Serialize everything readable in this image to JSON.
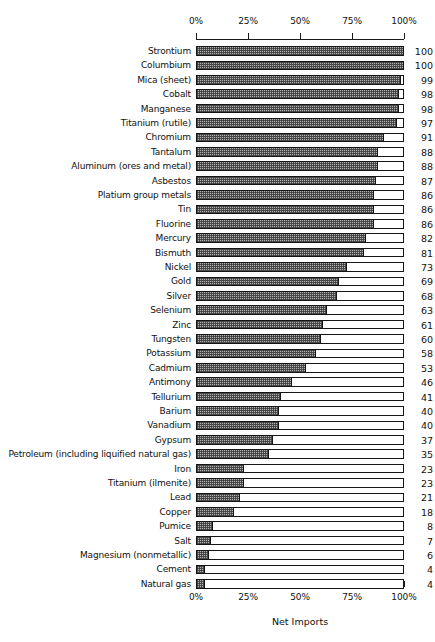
{
  "chart_data": {
    "type": "bar",
    "orientation": "horizontal",
    "title": "",
    "xlabel": "Net Imports",
    "ylabel": "",
    "xlim": [
      0,
      100
    ],
    "grid": false,
    "legend": null,
    "axis_tick_labels": [
      "0%",
      "25%",
      "50%",
      "75%",
      "100%"
    ],
    "axis_tick_values": [
      0,
      25,
      50,
      75,
      100
    ],
    "value_unit": "percent",
    "categories": [
      "Strontium",
      "Columbium",
      "Mica (sheet)",
      "Cobalt",
      "Manganese",
      "Titanium (rutile)",
      "Chromium",
      "Tantalum",
      "Aluminum (ores and metal)",
      "Asbestos",
      "Platium group metals",
      "Tin",
      "Fluorine",
      "Mercury",
      "Bismuth",
      "Nickel",
      "Gold",
      "Silver",
      "Selenium",
      "Zinc",
      "Tungsten",
      "Potassium",
      "Cadmium",
      "Antimony",
      "Tellurium",
      "Barium",
      "Vanadium",
      "Gypsum",
      "Petroleum (including liquified natural gas)",
      "Iron",
      "Titanium (ilmenite)",
      "Lead",
      "Copper",
      "Pumice",
      "Salt",
      "Magnesium (nonmetallic)",
      "Cement",
      "Natural gas"
    ],
    "values": [
      100,
      100,
      99,
      98,
      98,
      97,
      91,
      88,
      88,
      87,
      86,
      86,
      86,
      82,
      81,
      73,
      69,
      68,
      63,
      61,
      60,
      58,
      53,
      46,
      41,
      40,
      40,
      37,
      35,
      23,
      23,
      21,
      18,
      8,
      7,
      6,
      4,
      4
    ]
  },
  "style": {
    "bar_fill_color": "#b2b2b2",
    "bar_hatch_color": "#3c3c3c",
    "bar_outline_color": "#151515",
    "background_color": "#ffffff",
    "text_color": "#111111"
  }
}
